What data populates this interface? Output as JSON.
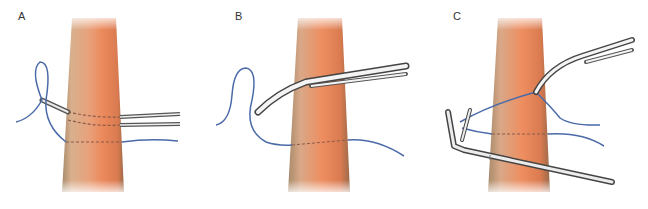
{
  "figure": {
    "panels": [
      {
        "label": "A",
        "description": "Instrument passed behind vessel with suture loop"
      },
      {
        "label": "B",
        "description": "Curved instrument passed behind vessel, suture beneath"
      },
      {
        "label": "C",
        "description": "Suture retrieved with clip applier and curved forceps"
      }
    ]
  },
  "colors": {
    "vessel_core": "#e8865a",
    "vessel_edge": "#c9a27e",
    "suture": "#4a6aa8",
    "instrument_light": "#f2f2f2",
    "instrument_dark": "#555555",
    "dashed_path": "#8a5a4a",
    "label": "#333333"
  }
}
